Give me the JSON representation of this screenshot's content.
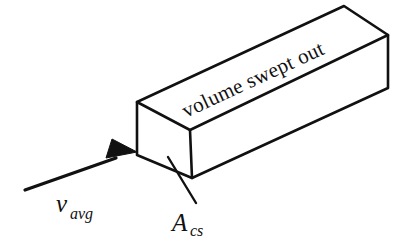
{
  "figure": {
    "background_color": "#ffffff",
    "ink_color": "#111111",
    "labels": {
      "volume_swept_out": "volume swept out",
      "velocity_symbol": "v",
      "velocity_subscript": "avg",
      "area_symbol": "A",
      "area_subscript": "cs"
    },
    "annotations": {
      "velocity_full": "v_avg",
      "area_full": "A_cs"
    },
    "geometry": {
      "front_face": [
        [
          137,
          102
        ],
        [
          190,
          130
        ],
        [
          192,
          178
        ],
        [
          137,
          155
        ]
      ],
      "top_face": [
        [
          137,
          102
        ],
        [
          344,
          6
        ],
        [
          388,
          35
        ],
        [
          190,
          130
        ]
      ],
      "side_face": [
        [
          190,
          130
        ],
        [
          388,
          35
        ],
        [
          388,
          88
        ],
        [
          192,
          178
        ]
      ],
      "arrow_tail": [
        25,
        190
      ],
      "arrow_tip": [
        137,
        152
      ],
      "leader_start": [
        170,
        158
      ],
      "leader_end": [
        196,
        202
      ]
    }
  }
}
